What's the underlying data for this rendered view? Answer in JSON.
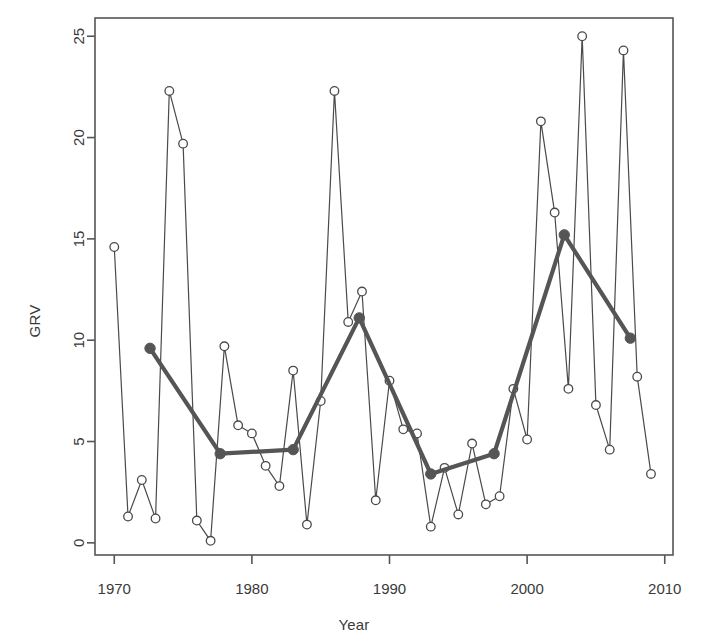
{
  "chart": {
    "title": "",
    "xlabel": "Year",
    "ylabel": "GRV",
    "background": "#ffffff",
    "series_color": "#4a4a4a",
    "smooth_color": "#555555",
    "axis_color": "#555555"
  },
  "axes": {
    "x_ticks": [
      1970,
      1980,
      1990,
      2000,
      2010
    ],
    "y_ticks": [
      0,
      5,
      10,
      15,
      20,
      25
    ],
    "xlim": [
      1968.6,
      2010.6
    ],
    "ylim": [
      -0.6,
      25.9
    ]
  },
  "chart_data": {
    "type": "line",
    "title": "",
    "xlabel": "Year",
    "ylabel": "GRV",
    "xlim": [
      1968.6,
      2010.6
    ],
    "ylim": [
      -0.6,
      25.9
    ],
    "grid": false,
    "legend": "none",
    "x_ticks": [
      1970,
      1980,
      1990,
      2000,
      2010
    ],
    "y_ticks": [
      0,
      5,
      10,
      15,
      20,
      25
    ],
    "series": [
      {
        "name": "GRV annual",
        "style": "thin-line-open-circles",
        "marker": "open-circle",
        "x": [
          1970,
          1971,
          1972,
          1973,
          1974,
          1975,
          1976,
          1977,
          1978,
          1979,
          1980,
          1981,
          1982,
          1983,
          1984,
          1985,
          1986,
          1987,
          1988,
          1989,
          1990,
          1991,
          1992,
          1993,
          1994,
          1995,
          1996,
          1997,
          1998,
          1999,
          2000,
          2001,
          2002,
          2003,
          2004,
          2005,
          2006,
          2007,
          2008,
          2009
        ],
        "values": [
          14.6,
          1.3,
          3.1,
          1.2,
          22.3,
          19.7,
          1.1,
          0.1,
          9.7,
          5.8,
          5.4,
          3.8,
          2.8,
          8.5,
          0.9,
          7.0,
          22.3,
          10.9,
          12.4,
          2.1,
          8.0,
          5.6,
          5.4,
          0.8,
          3.7,
          1.4,
          4.9,
          1.9,
          2.3,
          7.6,
          5.1,
          20.8,
          16.3,
          7.6,
          25.0,
          6.8,
          4.6,
          24.3,
          8.2,
          3.4
        ]
      },
      {
        "name": "GRV smoothed trend",
        "style": "thick-line-filled-circles",
        "marker": "filled-circle",
        "x": [
          1972.6,
          1977.7,
          1983.0,
          1987.8,
          1993.0,
          1997.6,
          2002.7,
          2007.5
        ],
        "values": [
          9.6,
          4.4,
          4.6,
          11.1,
          3.4,
          4.4,
          15.2,
          10.1
        ]
      }
    ]
  }
}
